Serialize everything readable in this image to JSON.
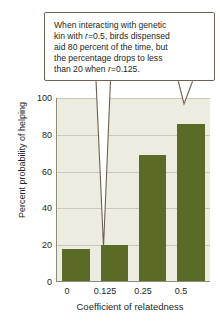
{
  "chart_data": {
    "type": "bar",
    "title": "",
    "xlabel": "Coefficient of relatedness",
    "ylabel": "Percent probability of helping",
    "categories": [
      "0",
      "0.125",
      "0.25",
      "0.5"
    ],
    "values": [
      18,
      20,
      69,
      86
    ],
    "ylim": [
      0,
      100
    ],
    "yticks": [
      "0",
      "20",
      "40",
      "60",
      "80",
      "100"
    ],
    "grid": true,
    "legend": "none",
    "bar_color": "#5a6b28",
    "plot_background": "#edece1",
    "annotations": [
      {
        "text": "When interacting with genetic kin with r=0.5, birds dispensed aid 80 percent of the time, but the percentage drops to less than 20 when r=0.125.",
        "points_to": [
          "0.125",
          "0.5"
        ]
      }
    ]
  },
  "callout": {
    "line1_a": "When interacting with genetic",
    "line2_a": "kin with ",
    "line2_r": "r",
    "line2_b": "=0.5, birds dispensed",
    "line3_a": "aid 80 percent of the time, but",
    "line4_a": "the percentage drops to less",
    "line5_a": "than 20 when ",
    "line5_r": "r",
    "line5_b": "=0.125."
  },
  "axes": {
    "y_title": "Percent probability of helping",
    "x_title": "Coefficient of relatedness",
    "y_ticks": [
      "100",
      "80",
      "60",
      "40",
      "20",
      "0"
    ],
    "x_ticks": [
      "0",
      "0.125",
      "0.25",
      "0.5"
    ]
  },
  "colors": {
    "bar": "#5a6b28",
    "plot_bg": "#edece1",
    "grid": "#c9c7b8",
    "callout_border": "#6e6052",
    "text": "#231f1c"
  }
}
